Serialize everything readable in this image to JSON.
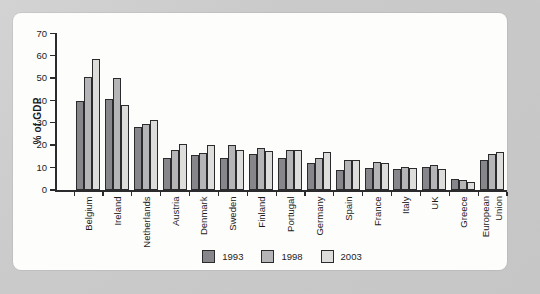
{
  "colors": {
    "page_bg": "#c9cac9",
    "panel_bg": "#fdfdfc",
    "axis": "#2b2b2d",
    "text": "#1c1c1c"
  },
  "chart_data": {
    "type": "bar",
    "title": "",
    "xlabel": "",
    "ylabel": "% of GDP",
    "ylim": [
      0,
      70
    ],
    "yticks": [
      0,
      10,
      20,
      30,
      40,
      50,
      60,
      70
    ],
    "grid": false,
    "legend_position": "bottom",
    "bar_outline": "#2b2b2d",
    "categories": [
      "Belgium",
      "Ireland",
      "Netherlands",
      "Austria",
      "Denmark",
      "Sweden",
      "Finland",
      "Portugal",
      "Germany",
      "Spain",
      "France",
      "Italy",
      "UK",
      "Greece",
      "European Union"
    ],
    "series": [
      {
        "name": "1993",
        "color": "#87878b",
        "values": [
          40,
          40.5,
          28,
          14.5,
          15.5,
          14.5,
          16,
          14.5,
          12,
          9,
          10,
          9.5,
          10.5,
          5,
          13.5
        ]
      },
      {
        "name": "1998",
        "color": "#b5b5b7",
        "values": [
          50.5,
          50,
          29.5,
          18,
          16.5,
          20,
          19,
          18,
          14.5,
          13.5,
          12.5,
          10.5,
          11,
          4.5,
          16
        ]
      },
      {
        "name": "2003",
        "color": "#dddddb",
        "values": [
          58.5,
          38,
          31.5,
          20.5,
          20,
          18,
          17.5,
          18,
          17,
          13.5,
          12,
          10,
          9.5,
          3.5,
          17
        ]
      }
    ]
  }
}
